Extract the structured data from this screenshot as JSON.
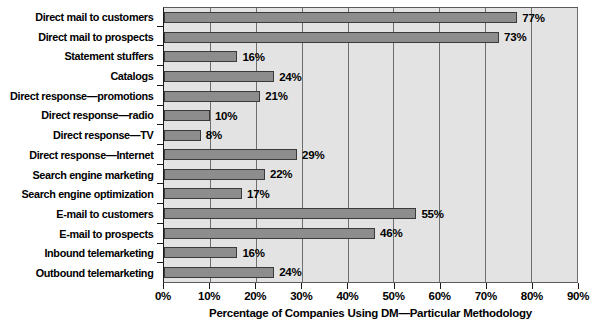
{
  "chart_data": {
    "type": "bar",
    "orientation": "horizontal",
    "title": "",
    "xlabel": "Percentage of Companies Using DM—Particular Methodology",
    "ylabel": "",
    "xlim": [
      0,
      90
    ],
    "xticks": [
      "0%",
      "10%",
      "20%",
      "30%",
      "40%",
      "50%",
      "60%",
      "70%",
      "80%",
      "90%"
    ],
    "xtick_values": [
      0,
      10,
      20,
      30,
      40,
      50,
      60,
      70,
      80,
      90
    ],
    "grid": true,
    "legend": false,
    "categories": [
      "Direct mail to customers",
      "Direct mail to prospects",
      "Statement stuffers",
      "Catalogs",
      "Direct response—promotions",
      "Direct response—radio",
      "Direct response—TV",
      "Direct response—Internet",
      "Search engine marketing",
      "Search engine optimization",
      "E-mail to customers",
      "E-mail to prospects",
      "Inbound telemarketing",
      "Outbound telemarketing"
    ],
    "values": [
      77,
      73,
      16,
      24,
      21,
      10,
      8,
      29,
      22,
      17,
      55,
      46,
      16,
      24
    ],
    "data_labels": [
      "77%",
      "73%",
      "16%",
      "24%",
      "21%",
      "10%",
      "8%",
      "29%",
      "22%",
      "17%",
      "55%",
      "46%",
      "16%",
      "24%"
    ],
    "colors": {
      "bar_fill": "#8d8d8d",
      "bar_edge": "#3a3a3a",
      "plot_background": "#e3e3e3",
      "gridline": "#6e6e6e",
      "axis": "#1a1a1a",
      "text": "#000000",
      "page_background": "#ffffff"
    }
  }
}
